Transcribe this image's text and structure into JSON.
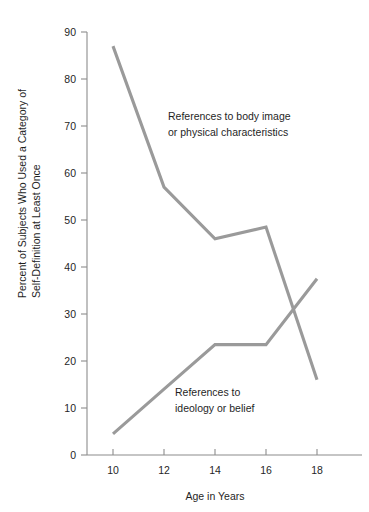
{
  "chart_data": {
    "type": "line",
    "title": "",
    "xlabel": "Age in Years",
    "ylabel": "Percent of Subjects Who Used a Category of Self-Definition at Least Once",
    "ylabel_line1": "Percent of Subjects Who Used a Category of",
    "ylabel_line2": "Self-Definition at Least Once",
    "x": [
      10,
      12,
      14,
      16,
      18
    ],
    "xticklabels": [
      "10",
      "12",
      "14",
      "16",
      "18"
    ],
    "yticks": [
      0,
      10,
      20,
      30,
      40,
      50,
      60,
      70,
      80,
      90
    ],
    "yticklabels": [
      "0",
      "10",
      "20",
      "30",
      "40",
      "50",
      "60",
      "70",
      "80",
      "90"
    ],
    "xlim": [
      9,
      19.2
    ],
    "ylim": [
      0,
      90
    ],
    "grid": false,
    "legend_position": "inline-annotations",
    "line_color": "#9a9a9a",
    "axis_color": "#8c8c8c",
    "background_color": "#ffffff",
    "series": [
      {
        "name": "References to body image or physical characteristics",
        "values": [
          87,
          57,
          46,
          48.5,
          16
        ],
        "annotation_line1": "References to body image",
        "annotation_line2": "or physical characteristics"
      },
      {
        "name": "References to ideology or belief",
        "values": [
          4.5,
          14,
          23.5,
          23.5,
          37.5
        ],
        "annotation_line1": "References to",
        "annotation_line2": "ideology or belief"
      }
    ],
    "annotations": [
      {
        "id": "body-image",
        "line1": "References to body image",
        "line2": "or physical characteristics"
      },
      {
        "id": "ideology",
        "line1": "References to",
        "line2": "ideology or belief"
      }
    ]
  }
}
